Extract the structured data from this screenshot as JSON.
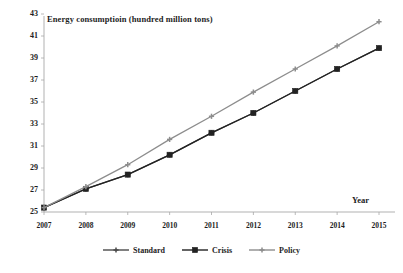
{
  "chart_data": {
    "type": "line",
    "title": "",
    "ylabel": "Energy consumptioin (hundred million tons)",
    "xlabel": "Year",
    "categories": [
      "2007",
      "2008",
      "2009",
      "2010",
      "2011",
      "2012",
      "2013",
      "2014",
      "2015"
    ],
    "x": [
      2007,
      2008,
      2009,
      2010,
      2011,
      2012,
      2013,
      2014,
      2015
    ],
    "ylim": [
      25,
      43
    ],
    "yticks": [
      25,
      27,
      29,
      31,
      33,
      35,
      37,
      39,
      41,
      43
    ],
    "grid": false,
    "legend_position": "bottom",
    "series": [
      {
        "name": "Standard",
        "color": "#4a4a4a",
        "marker": "plus",
        "values": [
          25.4,
          27.1,
          28.4,
          30.2,
          32.2,
          34.0,
          36.0,
          38.0,
          39.9
        ]
      },
      {
        "name": "Crisis",
        "color": "#222222",
        "marker": "square",
        "values": [
          25.4,
          27.1,
          28.4,
          30.2,
          32.2,
          34.0,
          36.0,
          38.0,
          39.9
        ]
      },
      {
        "name": "Policy",
        "color": "#8d8d8d",
        "marker": "plus",
        "values": [
          25.4,
          27.3,
          29.3,
          31.6,
          33.7,
          35.9,
          38.0,
          40.1,
          42.3
        ]
      }
    ]
  },
  "axis": {
    "y_title": "Energy consumptioin (hundred million tons)",
    "x_title": "Year",
    "y_labels": [
      "43",
      "41",
      "39",
      "37",
      "35",
      "33",
      "31",
      "29",
      "27",
      "25"
    ],
    "x_labels": [
      "2007",
      "2008",
      "2009",
      "2010",
      "2011",
      "2012",
      "2013",
      "2014",
      "2015"
    ]
  },
  "legend": {
    "items": [
      {
        "label": "Standard",
        "color": "#4a4a4a"
      },
      {
        "label": "Crisis",
        "color": "#222222"
      },
      {
        "label": "Policy",
        "color": "#8d8d8d"
      }
    ]
  }
}
